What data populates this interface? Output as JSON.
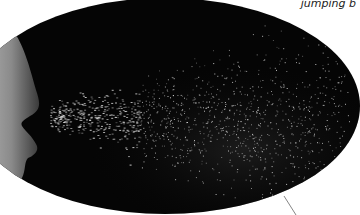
{
  "caption": {
    "text": "jumping b"
  },
  "image": {
    "subject": "person sneezing, droplet spray",
    "background_color": "#050505",
    "spray_color": "#d8d8d8"
  }
}
